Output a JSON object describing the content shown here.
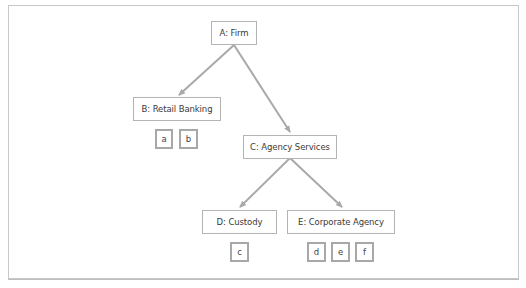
{
  "diagram": {
    "type": "organization-tree",
    "colors": {
      "edge": "#a9a9a9",
      "node_border": "#b4b4b4",
      "leaf_border": "#a8a8a8",
      "text": "#3a3a3a"
    },
    "nodes": {
      "a": {
        "id": "A",
        "label": "A: Firm"
      },
      "b": {
        "id": "B",
        "label": "B: Retail Banking"
      },
      "c": {
        "id": "C",
        "label": "C: Agency Services"
      },
      "d": {
        "id": "D",
        "label": "D: Custody"
      },
      "e": {
        "id": "E",
        "label": "E: Corporate Agency"
      }
    },
    "edges": [
      {
        "from": "A",
        "to": "B"
      },
      {
        "from": "A",
        "to": "C"
      },
      {
        "from": "C",
        "to": "D"
      },
      {
        "from": "C",
        "to": "E"
      }
    ],
    "leaves": {
      "b": [
        "a",
        "b"
      ],
      "d": [
        "c"
      ],
      "e": [
        "d",
        "e",
        "f"
      ]
    }
  }
}
